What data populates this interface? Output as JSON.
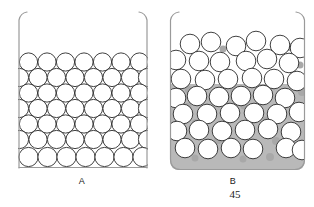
{
  "figure": {
    "page_number": "45",
    "background_color": "#ffffff",
    "outline_color": "#9a9a9a",
    "circle_stroke_color": "#2b2b2b",
    "circle_fill_color": "#ffffff",
    "liquid_fill_color": "#b9b9b9",
    "interstitial_fill_color": "#a8a8a8"
  },
  "beakers": [
    {
      "id": "beaker-a",
      "label": "A",
      "state_description": "ordered close-packed spheres, no shading between spheres",
      "geometry": {
        "x": 18,
        "y": 12,
        "width": 130,
        "height": 156,
        "wall_top_y": 12,
        "floor_y": 168
      },
      "fill": {
        "shaded": false,
        "level_y": null
      },
      "circle_radius": 9.1,
      "circle_count": 49,
      "rows": [
        {
          "cy": 62,
          "cxs": [
            28.5,
            47.0,
            65.5,
            84.0,
            102.5,
            121.0,
            139.5
          ]
        },
        {
          "cy": 79,
          "cxs": [
            28.5,
            47.0,
            65.5,
            84.0,
            102.5,
            121.0,
            139.5
          ]
        },
        {
          "cy": 96,
          "cxs": [
            28.5,
            47.0,
            65.5,
            84.0,
            102.5,
            121.0,
            139.5
          ]
        },
        {
          "cy": 113,
          "cxs": [
            28.5,
            47.0,
            65.5,
            84.0,
            102.5,
            121.0,
            139.5
          ]
        },
        {
          "cy": 130,
          "cxs": [
            28.5,
            47.0,
            65.5,
            84.0,
            102.5,
            121.0,
            139.5
          ]
        },
        {
          "cy": 147,
          "cxs": [
            28.5,
            47.0,
            65.5,
            84.0,
            102.5,
            121.0,
            139.5
          ]
        },
        {
          "cy": 159,
          "cxs": [
            28.5,
            47.0,
            65.5,
            84.0,
            102.5,
            121.0,
            139.5
          ]
        }
      ]
    },
    {
      "id": "beaker-b",
      "label": "B",
      "state_description": "disordered randomly packed spheres with shaded liquid filling lower region",
      "geometry": {
        "x": 170,
        "y": 12,
        "width": 135,
        "height": 158,
        "wall_top_y": 12,
        "floor_y": 170
      },
      "fill": {
        "shaded": true,
        "level_y": 84
      },
      "circle_radius": 9.8,
      "circle_count": 44,
      "circles": [
        {
          "cx": 190,
          "cy": 44
        },
        {
          "cx": 211,
          "cy": 42
        },
        {
          "cx": 236,
          "cy": 46
        },
        {
          "cx": 256,
          "cy": 41
        },
        {
          "cx": 280,
          "cy": 45
        },
        {
          "cx": 299,
          "cy": 48
        },
        {
          "cx": 178,
          "cy": 60
        },
        {
          "cx": 199,
          "cy": 61
        },
        {
          "cx": 220,
          "cy": 62
        },
        {
          "cx": 246,
          "cy": 61
        },
        {
          "cx": 267,
          "cy": 59
        },
        {
          "cx": 289,
          "cy": 63
        },
        {
          "cx": 182,
          "cy": 79
        },
        {
          "cx": 205,
          "cy": 80
        },
        {
          "cx": 228,
          "cy": 79
        },
        {
          "cx": 252,
          "cy": 78
        },
        {
          "cx": 274,
          "cy": 79
        },
        {
          "cx": 296,
          "cy": 81
        },
        {
          "cx": 177,
          "cy": 98
        },
        {
          "cx": 196,
          "cy": 96
        },
        {
          "cx": 219,
          "cy": 97
        },
        {
          "cx": 241,
          "cy": 96
        },
        {
          "cx": 263,
          "cy": 95
        },
        {
          "cx": 285,
          "cy": 98
        },
        {
          "cx": 183,
          "cy": 114
        },
        {
          "cx": 207,
          "cy": 114
        },
        {
          "cx": 230,
          "cy": 113
        },
        {
          "cx": 254,
          "cy": 113
        },
        {
          "cx": 277,
          "cy": 114
        },
        {
          "cx": 298,
          "cy": 112
        },
        {
          "cx": 178,
          "cy": 131
        },
        {
          "cx": 199,
          "cy": 130
        },
        {
          "cx": 222,
          "cy": 131
        },
        {
          "cx": 245,
          "cy": 130
        },
        {
          "cx": 268,
          "cy": 129
        },
        {
          "cx": 291,
          "cy": 132
        },
        {
          "cx": 185,
          "cy": 148
        },
        {
          "cx": 208,
          "cy": 149
        },
        {
          "cx": 231,
          "cy": 148
        },
        {
          "cx": 253,
          "cy": 149
        },
        {
          "cx": 286,
          "cy": 148
        },
        {
          "cx": 300,
          "cy": 150
        },
        {
          "cx": 264,
          "cy": 139
        },
        {
          "cx": 240,
          "cy": 140
        }
      ],
      "interstitial_patches": [
        {
          "cx": 289,
          "cy": 47,
          "r": 4
        },
        {
          "cx": 223,
          "cy": 49,
          "r": 3.5
        },
        {
          "cx": 300,
          "cy": 65,
          "r": 3.5
        },
        {
          "cx": 189,
          "cy": 90,
          "r": 4
        },
        {
          "cx": 234,
          "cy": 90,
          "r": 4
        },
        {
          "cx": 302,
          "cy": 92,
          "r": 4
        },
        {
          "cx": 188,
          "cy": 106,
          "r": 3.5
        },
        {
          "cx": 244,
          "cy": 106,
          "r": 3.5
        },
        {
          "cx": 196,
          "cy": 123,
          "r": 4
        },
        {
          "cx": 266,
          "cy": 120,
          "r": 3.5
        },
        {
          "cx": 218,
          "cy": 140,
          "r": 4
        },
        {
          "cx": 276,
          "cy": 141,
          "r": 4
        },
        {
          "cx": 195,
          "cy": 158,
          "r": 3.5
        },
        {
          "cx": 243,
          "cy": 159,
          "r": 3.5
        },
        {
          "cx": 270,
          "cy": 157,
          "r": 4
        }
      ]
    }
  ]
}
